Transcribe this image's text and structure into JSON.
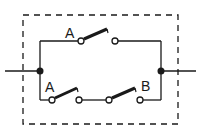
{
  "diagram": {
    "type": "switch-circuit",
    "colors": {
      "line": "#1a1a1a",
      "background": "#ffffff"
    },
    "enclosure": {
      "style": "dashed"
    },
    "labels": {
      "top_switch": "A",
      "bottom_switch_1": "A",
      "bottom_switch_2": "B"
    },
    "branches": [
      {
        "name": "top",
        "switches": [
          "A"
        ]
      },
      {
        "name": "bottom",
        "switches": [
          "A",
          "B"
        ]
      }
    ]
  }
}
